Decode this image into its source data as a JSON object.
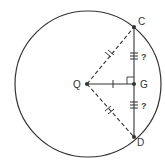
{
  "diagram": {
    "type": "geometry-circle-chord",
    "colors": {
      "stroke": "#333333",
      "background": "#ffffff"
    },
    "circle": {
      "cx": 88,
      "cy": 84,
      "r": 73
    },
    "points": {
      "Q": {
        "label": "Q",
        "x": 87,
        "y": 84,
        "role": "center"
      },
      "C": {
        "label": "C",
        "x": 134,
        "y": 27
      },
      "G": {
        "label": "G",
        "x": 134,
        "y": 84
      },
      "D": {
        "label": "D",
        "x": 134,
        "y": 137
      }
    },
    "segments": [
      {
        "from": "Q",
        "to": "C",
        "style": "dashed",
        "ticks": 2
      },
      {
        "from": "Q",
        "to": "D",
        "style": "dashed",
        "ticks": 2
      },
      {
        "from": "Q",
        "to": "G",
        "style": "solid",
        "ticks": 1
      },
      {
        "from": "C",
        "to": "G",
        "style": "solid",
        "ticks": 3,
        "annotation": "?"
      },
      {
        "from": "G",
        "to": "D",
        "style": "solid",
        "ticks": 3,
        "annotation": "?"
      }
    ],
    "right_angle_at": "G",
    "annotations": {
      "cg_unknown": "?",
      "gd_unknown": "?"
    }
  }
}
